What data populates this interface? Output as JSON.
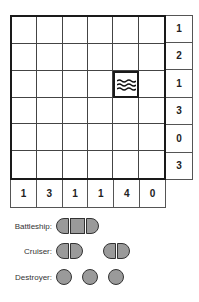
{
  "puzzle": {
    "grid_size": 6,
    "water_cell": {
      "row": 2,
      "col": 4
    },
    "row_clues": [
      "1",
      "2",
      "1",
      "3",
      "0",
      "3"
    ],
    "col_clues": [
      "1",
      "3",
      "1",
      "1",
      "4",
      "0"
    ]
  },
  "legend": {
    "battleship_label": "Battleship:",
    "cruiser_label": "Cruiser:",
    "destroyer_label": "Destroyer:"
  },
  "colors": {
    "ship_fill": "#9a9a9a",
    "line": "#1a1a1a"
  },
  "icons": {
    "water": "water-waves-icon"
  }
}
